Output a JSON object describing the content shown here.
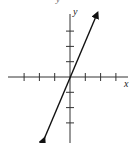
{
  "chart_data": {
    "type": "line",
    "title": "",
    "xlabel": "x",
    "ylabel": "y",
    "xlim": [
      -4,
      4
    ],
    "ylim": [
      -4,
      4
    ],
    "grid": false,
    "tick_spacing": 1,
    "x_ticks": [
      -3,
      -2,
      -1,
      1,
      2,
      3
    ],
    "y_ticks": [
      -3,
      -2,
      -1,
      1,
      2,
      3
    ],
    "series": [
      {
        "name": "line",
        "x": [
          -1.67,
          1.8
        ],
        "y": [
          -4.0,
          4.2
        ],
        "arrows": "both"
      }
    ]
  },
  "labels": {
    "x_axis": "x",
    "y_axis": "y",
    "top_cropped": "y"
  }
}
